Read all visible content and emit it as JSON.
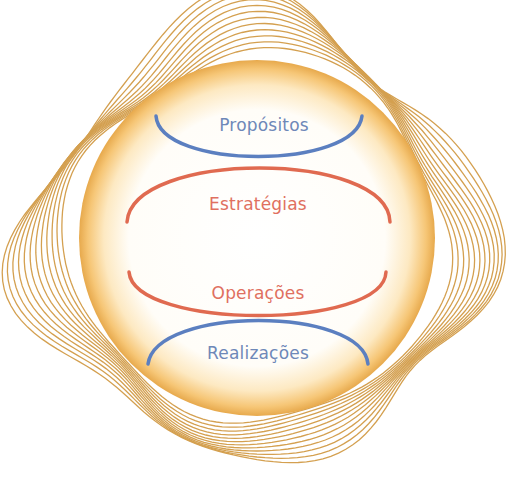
{
  "diagram": {
    "title": "",
    "colors": {
      "wave_lines": "#d4a050",
      "circle_edge": "#f0b24a",
      "circle_center": "#ffffff",
      "blue_arc": "#5b7fc0",
      "red_arc": "#e06a50",
      "blue_text": "#6e88b8",
      "red_text": "#e07060"
    },
    "circle": {
      "cx": 257,
      "cy": 238,
      "r": 178
    },
    "layers": [
      {
        "id": "propositos",
        "label": "Propósitos",
        "color_key": "blue"
      },
      {
        "id": "estrategias",
        "label": "Estratégias",
        "color_key": "red"
      },
      {
        "id": "operacoes",
        "label": "Operações",
        "color_key": "red"
      },
      {
        "id": "realizacoes",
        "label": "Realizações",
        "color_key": "blue"
      }
    ]
  }
}
